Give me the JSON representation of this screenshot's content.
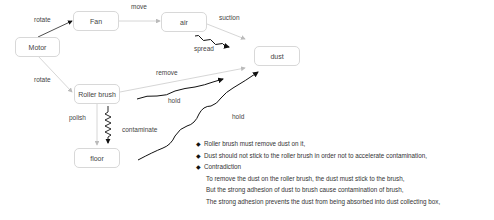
{
  "nodes": {
    "motor": "Motor",
    "fan": "Fan",
    "air": "air",
    "dust": "dust",
    "roller_brush": "Roller brush",
    "floor": "floor"
  },
  "edge_labels": {
    "motor_fan": "rotate",
    "fan_air": "move",
    "air_dust": "suction",
    "air_spread": "spread",
    "motor_roller": "rotate",
    "roller_dust": "remove",
    "roller_hold": "hold",
    "floor_hold": "hold",
    "roller_floor": "polish",
    "roller_contaminate": "contaminate"
  },
  "notes": {
    "bullet_icon": "◆",
    "bullets": [
      "Roller brush must remove dust on it,",
      "Dust should not stick to the roller brush in order not to accelerate contamination,",
      "Contradiction"
    ],
    "sub_lines": [
      "To remove the dust on the roller brush, the dust must stick to the brush,",
      "But the strong adhesion of dust to brush cause contamination of brush,",
      "The strong adhesion prevents the dust from being absorbed into dust collecting box,"
    ]
  }
}
